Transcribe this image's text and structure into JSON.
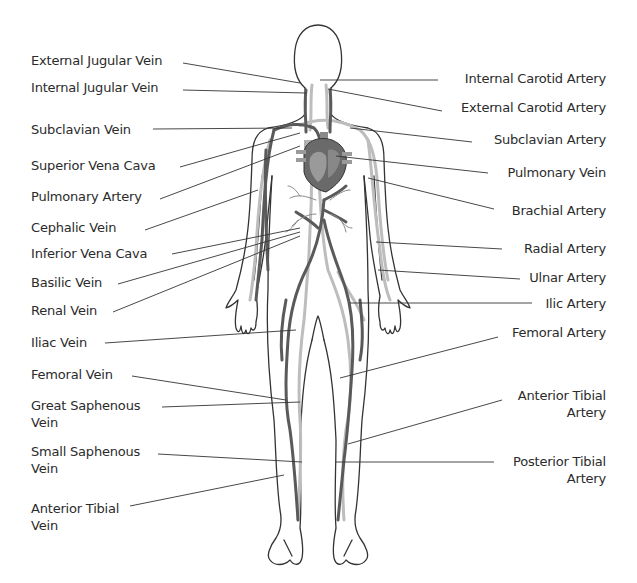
{
  "diagram": {
    "colors": {
      "background": "#ffffff",
      "outline": "#333333",
      "vein": "#5a5a5a",
      "artery": "#bdbdbd",
      "leader_line": "#333333",
      "text": "#2b2b2b"
    },
    "left_labels": [
      {
        "text": "External Jugular Vein",
        "top": 52
      },
      {
        "text": "Internal Jugular Vein",
        "top": 79
      },
      {
        "text": "Subclavian Vein",
        "top": 121
      },
      {
        "text": "Superior Vena Cava",
        "top": 157
      },
      {
        "text": "Pulmonary Artery",
        "top": 188
      },
      {
        "text": "Cephalic Vein",
        "top": 219
      },
      {
        "text": "Inferior Vena Cava",
        "top": 245
      },
      {
        "text": "Basilic Vein",
        "top": 274
      },
      {
        "text": "Renal Vein",
        "top": 302
      },
      {
        "text": "Iliac Vein",
        "top": 334
      },
      {
        "text": "Femoral Vein",
        "top": 366
      },
      {
        "text": "Great Saphenous",
        "line2": "Vein",
        "top": 397
      },
      {
        "text": "Small Saphenous",
        "line2": "Vein",
        "top": 443
      },
      {
        "text": "Anterior Tibial",
        "line2": "Vein",
        "top": 500
      }
    ],
    "right_labels": [
      {
        "text": "Internal Carotid Artery",
        "top": 70
      },
      {
        "text": "External Carotid Artery",
        "top": 99
      },
      {
        "text": "Subclavian Artery",
        "top": 131
      },
      {
        "text": "Pulmonary Vein",
        "top": 164
      },
      {
        "text": "Brachial Artery",
        "top": 202
      },
      {
        "text": "Radial Artery",
        "top": 240
      },
      {
        "text": "Ulnar Artery",
        "top": 269
      },
      {
        "text": "Ilic Artery",
        "top": 295
      },
      {
        "text": "Femoral Artery",
        "top": 324
      },
      {
        "text": "Anterior Tibial",
        "line2": "Artery",
        "top": 387
      },
      {
        "text": "Posterior Tibial",
        "line2": "Artery",
        "top": 453
      }
    ]
  }
}
